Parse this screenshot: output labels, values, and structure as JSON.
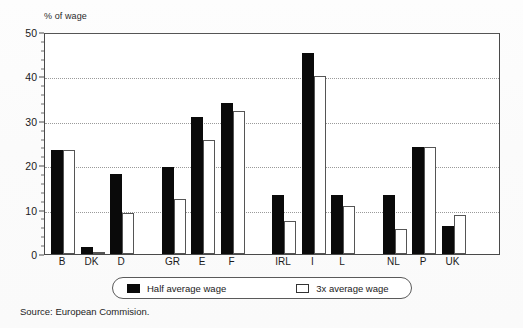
{
  "chart_data": {
    "type": "bar",
    "title": "",
    "subtitle": "",
    "xlabel": "",
    "ylabel": "% of wage",
    "ylim": [
      0,
      50
    ],
    "yticks": [
      0,
      10,
      20,
      30,
      40,
      50
    ],
    "ytick_labels": [
      "0",
      "10",
      "20",
      "30",
      "40",
      "50"
    ],
    "grid": "horizontal-dotted",
    "legend_position": "bottom-center",
    "categories": [
      "B",
      "DK",
      "D",
      "GR",
      "E",
      "F",
      "IRL",
      "I",
      "L",
      "NL",
      "P",
      "UK"
    ],
    "group_breaks_after": [
      "D",
      "F",
      "L"
    ],
    "series": [
      {
        "name": "Half average wage",
        "style": "filled-black",
        "color": "#0a0a0a",
        "values": [
          23.4,
          1.5,
          18.1,
          19.5,
          30.8,
          34.0,
          13.3,
          45.3,
          13.4,
          13.2,
          24.0,
          6.3
        ]
      },
      {
        "name": "3x average wage",
        "style": "outlined-white",
        "color": "#ffffff",
        "edge_color": "#555555",
        "values": [
          23.4,
          0.3,
          9.3,
          12.3,
          25.7,
          32.3,
          7.5,
          40.0,
          10.8,
          5.7,
          24.2,
          8.7
        ]
      }
    ]
  },
  "legend": {
    "items": [
      {
        "label": "Half average wage",
        "swatch": "filled-black-swatch"
      },
      {
        "label": "3x average wage",
        "swatch": "outlined-white-swatch"
      }
    ]
  },
  "footnote": {
    "source": "Source: European Commision."
  }
}
